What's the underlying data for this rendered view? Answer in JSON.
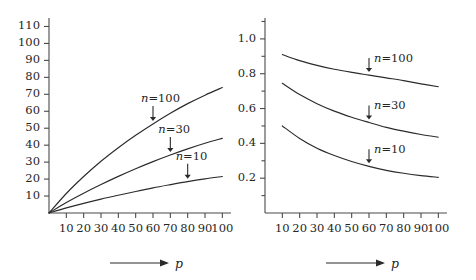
{
  "figure": {
    "background": "#ffffff",
    "line_color": "#2b2b2b",
    "axis_color": "#4a4a4a"
  },
  "chart_data": [
    {
      "type": "line",
      "panel": "left",
      "title": "",
      "xlabel": "p",
      "ylabel": "",
      "xlim": [
        0,
        105
      ],
      "ylim": [
        0,
        115
      ],
      "xticks": [
        10,
        20,
        30,
        40,
        50,
        60,
        70,
        80,
        90,
        100
      ],
      "xtick_labels": [
        "10",
        "20",
        "30",
        "40",
        "50",
        "60",
        "70",
        "80",
        "90",
        "100"
      ],
      "yticks": [
        10,
        20,
        30,
        40,
        50,
        60,
        70,
        80,
        90,
        100,
        110
      ],
      "ytick_labels": [
        "10",
        "20",
        "30",
        "40",
        "50",
        "60",
        "70",
        "80",
        "90",
        "100",
        "110"
      ],
      "grid": false,
      "legend": "inline-annotations",
      "x": [
        0,
        10,
        20,
        30,
        40,
        50,
        60,
        70,
        80,
        90,
        100
      ],
      "series": [
        {
          "name": "n=100",
          "label": "n=100",
          "label_n": "n",
          "label_rest": "=100",
          "annotation_arrow": "down",
          "values": [
            0,
            11.5,
            21.5,
            30.5,
            38.5,
            45.8,
            52.5,
            58.8,
            64.5,
            69.5,
            74.0
          ]
        },
        {
          "name": "n=30",
          "label": "n=30",
          "label_n": "n",
          "label_rest": "=30",
          "annotation_arrow": "down",
          "values": [
            0,
            6.2,
            11.7,
            16.8,
            21.6,
            26.1,
            30.3,
            34.2,
            37.8,
            41.1,
            44.0
          ]
        },
        {
          "name": "n=10",
          "label": "n=10",
          "label_n": "n",
          "label_rest": "=10",
          "annotation_arrow": "down",
          "values": [
            0,
            3.0,
            5.7,
            8.2,
            10.5,
            12.7,
            14.8,
            16.7,
            18.5,
            20.1,
            21.5
          ]
        }
      ]
    },
    {
      "type": "line",
      "panel": "right",
      "title": "",
      "xlabel": "p",
      "ylabel": "",
      "xlim": [
        0,
        105
      ],
      "ylim": [
        0.0,
        1.12
      ],
      "xticks": [
        10,
        20,
        30,
        40,
        50,
        60,
        70,
        80,
        90,
        100
      ],
      "xtick_labels": [
        "10",
        "20",
        "30",
        "40",
        "50",
        "60",
        "70",
        "80",
        "90",
        "100"
      ],
      "yticks": [
        0.2,
        0.4,
        0.6,
        0.8,
        1.0
      ],
      "ytick_labels": [
        "0.2",
        "0.4",
        "0.6",
        "0.8",
        "1.0"
      ],
      "yminor_ticks": [
        0.1,
        0.3,
        0.5,
        0.7,
        0.9,
        1.1
      ],
      "grid": false,
      "legend": "inline-annotations",
      "x": [
        10,
        20,
        30,
        40,
        50,
        60,
        70,
        80,
        90,
        100
      ],
      "series": [
        {
          "name": "n=100",
          "label": "n=100",
          "label_n": "n",
          "label_rest": "=100",
          "annotation_arrow": "down",
          "values": [
            0.91,
            0.875,
            0.848,
            0.826,
            0.808,
            0.792,
            0.776,
            0.76,
            0.742,
            0.725
          ]
        },
        {
          "name": "n=30",
          "label": "n=30",
          "label_n": "n",
          "label_rest": "=30",
          "annotation_arrow": "down",
          "values": [
            0.745,
            0.68,
            0.628,
            0.585,
            0.55,
            0.52,
            0.492,
            0.47,
            0.451,
            0.435
          ]
        },
        {
          "name": "n=10",
          "label": "n=10",
          "label_n": "n",
          "label_rest": "=10",
          "annotation_arrow": "down",
          "values": [
            0.5,
            0.428,
            0.372,
            0.33,
            0.296,
            0.268,
            0.245,
            0.228,
            0.215,
            0.205
          ]
        }
      ]
    }
  ]
}
